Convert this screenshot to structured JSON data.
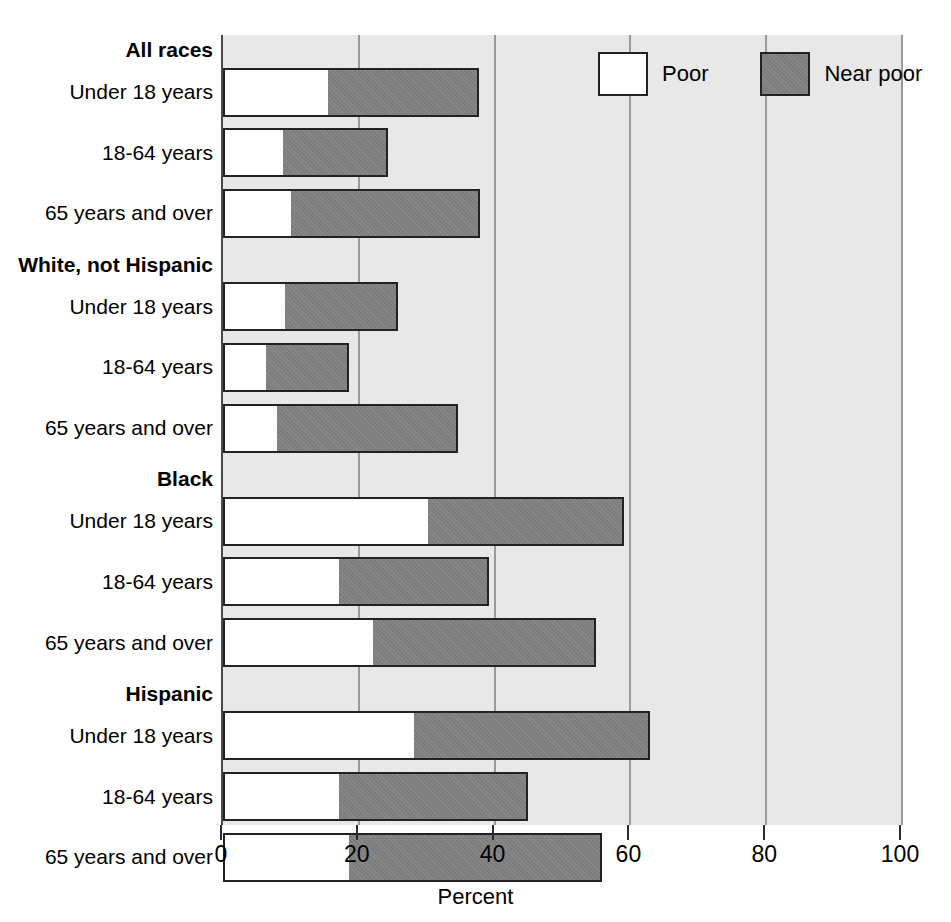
{
  "chart_data": {
    "type": "bar",
    "orientation": "horizontal",
    "stacked": true,
    "title": "",
    "xlabel": "Percent",
    "ylabel": "",
    "xlim": [
      0,
      100
    ],
    "xticks": [
      0,
      20,
      40,
      60,
      80,
      100
    ],
    "xticklabels": [
      "0",
      "20",
      "40",
      "60",
      "80",
      "100"
    ],
    "grid": "vertical",
    "legend_position": "top-right",
    "legend": [
      "Poor",
      "Near poor"
    ],
    "series": [
      {
        "name": "Poor",
        "color": "#ffffff",
        "values": [
          15.5,
          8.8,
          10.0,
          9.1,
          6.3,
          8.0,
          30.2,
          17.1,
          22.1,
          28.1,
          17.1,
          18.6
        ]
      },
      {
        "name": "Near poor",
        "color": "#7d7d7d",
        "values": [
          22.2,
          15.5,
          27.8,
          16.7,
          12.3,
          26.6,
          28.9,
          22.1,
          32.8,
          34.8,
          27.8,
          37.2
        ]
      }
    ],
    "categories": [
      "Under 18 years",
      "18-64 years",
      "65 years and over",
      "Under 18 years",
      "18-64 years",
      "65 years and over",
      "Under 18 years",
      "18-64 years",
      "65 years and over",
      "Under 18 years",
      "18-64 years",
      "65 years and over"
    ],
    "totals": [
      37.7,
      24.3,
      37.8,
      25.8,
      18.6,
      34.6,
      59.1,
      39.2,
      54.9,
      62.9,
      44.9,
      55.8
    ],
    "groups": [
      {
        "label": "All races",
        "rows": [
          {
            "label": "Under 18 years",
            "poor": 15.5,
            "near_poor": 22.2,
            "total": 37.7
          },
          {
            "label": "18-64 years",
            "poor": 8.8,
            "near_poor": 15.5,
            "total": 24.3
          },
          {
            "label": "65 years and over",
            "poor": 10.0,
            "near_poor": 27.8,
            "total": 37.8
          }
        ]
      },
      {
        "label": "White, not Hispanic",
        "rows": [
          {
            "label": "Under 18 years",
            "poor": 9.1,
            "near_poor": 16.7,
            "total": 25.8
          },
          {
            "label": "18-64 years",
            "poor": 6.3,
            "near_poor": 12.3,
            "total": 18.6
          },
          {
            "label": "65 years and over",
            "poor": 8.0,
            "near_poor": 26.6,
            "total": 34.6
          }
        ]
      },
      {
        "label": "Black",
        "rows": [
          {
            "label": "Under 18 years",
            "poor": 30.2,
            "near_poor": 28.9,
            "total": 59.1
          },
          {
            "label": "18-64 years",
            "poor": 17.1,
            "near_poor": 22.1,
            "total": 39.2
          },
          {
            "label": "65 years and over",
            "poor": 22.1,
            "near_poor": 32.8,
            "total": 54.9
          }
        ]
      },
      {
        "label": "Hispanic",
        "rows": [
          {
            "label": "Under 18 years",
            "poor": 28.1,
            "near_poor": 34.8,
            "total": 62.9
          },
          {
            "label": "18-64 years",
            "poor": 17.1,
            "near_poor": 27.8,
            "total": 44.9
          },
          {
            "label": "65 years and over",
            "poor": 18.6,
            "near_poor": 37.2,
            "total": 55.8
          }
        ]
      }
    ]
  },
  "axis": {
    "x_title": "Percent",
    "ticks": [
      "0",
      "20",
      "40",
      "60",
      "80",
      "100"
    ]
  },
  "legend": {
    "poor_label": "Poor",
    "near_poor_label": "Near poor"
  },
  "colors": {
    "poor": "#ffffff",
    "near_poor": "#7d7d7d",
    "plot_background": "#e8e8e8",
    "gridline": "#9a9a9a",
    "bar_outline": "#222222"
  }
}
